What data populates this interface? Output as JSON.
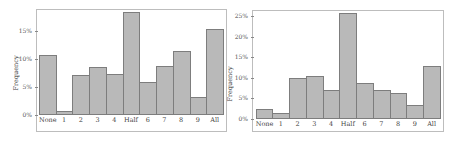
{
  "chart_data": [
    {
      "type": "bar",
      "title": "",
      "xlabel": "",
      "ylabel": "Frequency",
      "categories": [
        "None",
        "1",
        "2",
        "3",
        "4",
        "Half",
        "6",
        "7",
        "8",
        "9",
        "All"
      ],
      "values": [
        10.7,
        0.7,
        7.1,
        8.6,
        7.3,
        18.4,
        5.9,
        8.7,
        11.4,
        3.2,
        15.4
      ],
      "ylim": [
        0,
        19
      ],
      "yticks": [
        0,
        5,
        10,
        15
      ],
      "ytick_labels": [
        "0%",
        "5%",
        "10%",
        "15%"
      ],
      "grid": false,
      "legend": null
    },
    {
      "type": "bar",
      "title": "",
      "xlabel": "",
      "ylabel": "Frequency",
      "categories": [
        "None",
        "1",
        "2",
        "3",
        "4",
        "Half",
        "6",
        "7",
        "8",
        "9",
        "All"
      ],
      "values": [
        2.5,
        1.4,
        10.0,
        10.5,
        7.0,
        25.8,
        8.8,
        7.0,
        6.2,
        3.3,
        12.9
      ],
      "ylim": [
        0,
        26.5
      ],
      "yticks": [
        0,
        5,
        10,
        15,
        20,
        25
      ],
      "ytick_labels": [
        "0%",
        "5%",
        "10%",
        "15%",
        "20%",
        "25%"
      ],
      "grid": false,
      "legend": null
    }
  ],
  "colors": {
    "bar_fill": "#b9b9b9",
    "bar_edge": "#7d7d7d",
    "frame": "#bdbdbd"
  }
}
